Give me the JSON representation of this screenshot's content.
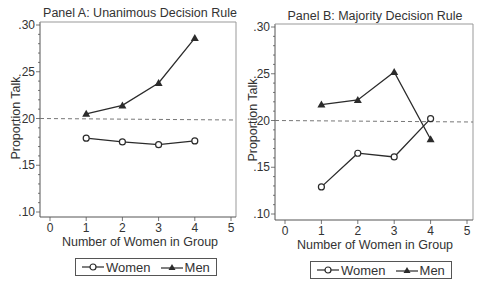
{
  "chart_data": [
    {
      "type": "line",
      "title": "Panel A: Unanimous Decision Rule",
      "xlabel": "Number of Women in Group",
      "ylabel": "Proportion Talk",
      "x": [
        1,
        2,
        3,
        4
      ],
      "xticks": [
        "0",
        "1",
        "2",
        "3",
        "4",
        "5"
      ],
      "yticks": [
        ".10",
        ".15",
        ".20",
        ".25",
        ".30"
      ],
      "xlim": [
        0,
        5
      ],
      "ylim": [
        0.1,
        0.3
      ],
      "series": [
        {
          "name": "Women",
          "marker": "hollow-circle",
          "values": [
            0.179,
            0.175,
            0.172,
            0.176
          ]
        },
        {
          "name": "Men",
          "marker": "filled-triangle",
          "values": [
            0.205,
            0.214,
            0.238,
            0.286
          ]
        }
      ],
      "reference_line": {
        "style": "dashed",
        "y": 0.2
      },
      "legend": {
        "position": "bottom",
        "entries": [
          "Women",
          "Men"
        ]
      },
      "grid": false
    },
    {
      "type": "line",
      "title": "Panel B: Majority Decision Rule",
      "xlabel": "Number of Women in Group",
      "ylabel": "Proportion Talk",
      "x": [
        1,
        2,
        3,
        4
      ],
      "xticks": [
        "0",
        "1",
        "2",
        "3",
        "4",
        "5"
      ],
      "yticks": [
        ".10",
        ".15",
        ".20",
        ".25",
        ".30"
      ],
      "xlim": [
        0,
        5
      ],
      "ylim": [
        0.1,
        0.3
      ],
      "series": [
        {
          "name": "Women",
          "marker": "hollow-circle",
          "values": [
            0.129,
            0.165,
            0.161,
            0.202
          ]
        },
        {
          "name": "Men",
          "marker": "filled-triangle",
          "values": [
            0.217,
            0.222,
            0.252,
            0.18
          ]
        }
      ],
      "reference_line": {
        "style": "dashed",
        "y": 0.2
      },
      "legend": {
        "position": "bottom",
        "entries": [
          "Women",
          "Men"
        ]
      },
      "grid": false
    }
  ],
  "panels": {
    "a": {
      "title": "Panel A: Unanimous Decision Rule",
      "xlabel": "Number of Women in Group",
      "ylabel": "Proportion Talk",
      "legend_women": "Women",
      "legend_men": "Men"
    },
    "b": {
      "title": "Panel B: Majority Decision Rule",
      "xlabel": "Number of Women in Group",
      "ylabel": "Proportion Talk",
      "legend_women": "Women",
      "legend_men": "Men"
    }
  },
  "colors": {
    "line": "#2b2b2b",
    "axis": "#555555",
    "reference": "#777777",
    "text": "#333333"
  }
}
